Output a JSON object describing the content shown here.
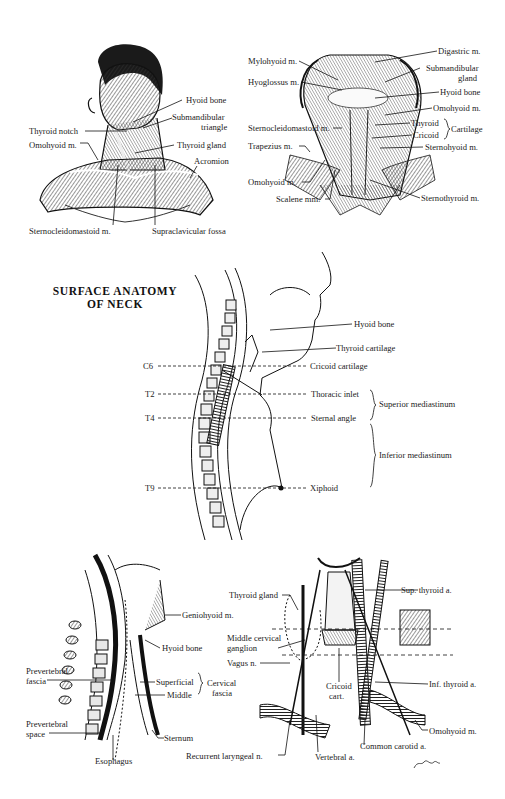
{
  "title": {
    "line1": "SURFACE ANATOMY",
    "line2": "OF NECK"
  },
  "panel_head": {
    "labels": {
      "hyoid_bone": "Hyoid bone",
      "submandibular_triangle_1": "Submandibular",
      "submandibular_triangle_2": "triangle",
      "thyroid_notch": "Thyroid notch",
      "thyroid_gland": "Thyroid gland",
      "omohyoid": "Omohyoid m.",
      "acromion": "Acromion",
      "sternocleidomastoid": "Sternocleidomastoid m.",
      "supraclavicular_fossa": "Supraclavicular fossa"
    }
  },
  "panel_muscles": {
    "labels": {
      "digastric": "Digastric m.",
      "mylohyoid": "Mylohyoid m.",
      "submandibular_gland_1": "Submandibular",
      "submandibular_gland_2": "gland",
      "hyoglossus": "Hyoglossus m.",
      "hyoid_bone": "Hyoid bone",
      "omohyoid_upper": "Omohyoid m.",
      "sternocleidomastoid": "Sternocleidomastoid m.",
      "thyroid": "Thyroid",
      "cricoid": "Cricoid",
      "cartilage": "Cartilage",
      "trapezius": "Trapezius m.",
      "sternohyoid": "Sternohyoid m.",
      "omohyoid_lower": "Omohyoid m.",
      "scalene": "Scalene mm.",
      "sternothyroid": "Sternothyroid m."
    }
  },
  "panel_sagittal": {
    "labels": {
      "hyoid_bone": "Hyoid bone",
      "thyroid_cartilage": "Thyroid cartilage",
      "cricoid_cartilage": "Cricoid cartilage",
      "thoracic_inlet": "Thoracic inlet",
      "sternal_angle": "Sternal angle",
      "xiphoid": "Xiphoid",
      "superior_mediastinum": "Superior mediastinum",
      "inferior_mediastinum": "Inferior mediastinum"
    },
    "levels": [
      "C6",
      "T2",
      "T4",
      "T9"
    ]
  },
  "panel_fascia": {
    "labels": {
      "geniohyoid": "Geniohyoid m.",
      "hyoid_bone": "Hyoid bone",
      "prevertebral_fascia_1": "Prevertebral",
      "prevertebral_fascia_2": "fascia",
      "superficial": "Superficial",
      "middle": "Middle",
      "cervical_fascia_1": "Cervical",
      "cervical_fascia_2": "fascia",
      "prevertebral_space_1": "Prevertebral",
      "prevertebral_space_2": "space",
      "sternum": "Sternum",
      "esophagus": "Esophagus"
    }
  },
  "panel_vessels": {
    "labels": {
      "thyroid_gland": "Thyroid gland",
      "sup_thyroid_a": "Sup. thyroid a.",
      "middle_cervical_ganglion_1": "Middle cervical",
      "middle_cervical_ganglion_2": "ganglion",
      "vagus": "Vagus n.",
      "cricoid_cart_1": "Cricoid",
      "cricoid_cart_2": "cart.",
      "inf_thyroid_a": "Inf. thyroid a.",
      "omohyoid": "Omohyoid m.",
      "common_carotid": "Common carotid a.",
      "recurrent_laryngeal": "Recurrent laryngeal n.",
      "vertebral_a": "Vertebral a."
    },
    "signature": "Bunsey"
  }
}
